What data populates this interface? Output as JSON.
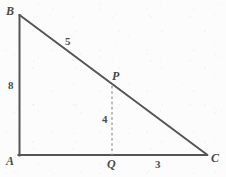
{
  "figure": {
    "background_color": "#fcfcfc",
    "stroke_color": "#555555",
    "dashed_color": "#9a9a9a",
    "label_color": "#4a4a4a",
    "vertices": [
      {
        "name": "B",
        "label": "B",
        "x": 19,
        "y": 15
      },
      {
        "name": "A",
        "label": "A",
        "x": 19,
        "y": 155
      },
      {
        "name": "C",
        "label": "C",
        "x": 207,
        "y": 155
      },
      {
        "name": "P",
        "label": "P",
        "x": 112,
        "y": 87
      },
      {
        "name": "Q",
        "label": "Q",
        "x": 112,
        "y": 155
      }
    ],
    "segments": [
      {
        "name": "side-AB",
        "from": "B",
        "to": "A",
        "style": "solid"
      },
      {
        "name": "side-AC",
        "from": "A",
        "to": "C",
        "style": "solid"
      },
      {
        "name": "hypotenuse-BC",
        "from": "B",
        "to": "C",
        "style": "solid"
      },
      {
        "name": "altitude-PQ",
        "from": "P",
        "to": "Q",
        "style": "dashed"
      }
    ],
    "measures": [
      {
        "name": "length-AB",
        "value": "8",
        "for_segment": "side-AB"
      },
      {
        "name": "length-BP",
        "value": "5",
        "for_segment": "hypotenuse-BC"
      },
      {
        "name": "length-PQ",
        "value": "4",
        "for_segment": "altitude-PQ"
      },
      {
        "name": "length-QC",
        "value": "3",
        "for_segment": "side-AC"
      }
    ]
  }
}
